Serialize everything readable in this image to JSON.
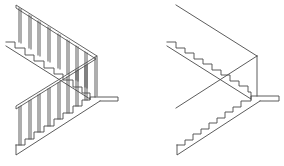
{
  "diagram": {
    "type": "stair-elevation-drawing",
    "figures": [
      {
        "id": "left",
        "label": "",
        "description": "Dog-leg stair elevation with handrails and balusters",
        "line_color": "#4a4a4a",
        "upper_flight": {
          "nosing_start": [
            6,
            42
          ],
          "steps": 8,
          "step_run": 10,
          "step_rise": 6.5
        },
        "lower_flight": {
          "steps": 8
        },
        "balusters_upper": 9,
        "balusters_lower": 9
      },
      {
        "id": "right",
        "label": "",
        "description": "Simplified stair elevation without balusters",
        "line_color": "#4a4a4a"
      }
    ]
  }
}
